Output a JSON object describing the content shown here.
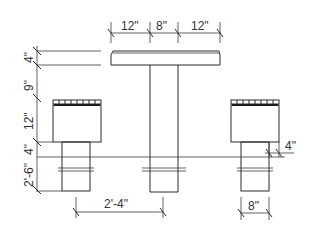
{
  "drawing": {
    "title": "Table and stool elevation",
    "colors": {
      "line": "#2a2a2a",
      "text": "#333333",
      "background": "#ffffff"
    },
    "top_dimensions": [
      "12\"",
      "8\"",
      "12\""
    ],
    "left_dimensions": {
      "table_top_thickness": "4\"",
      "gap_to_seat": "9\"",
      "seat_height": "12\"",
      "seat_base_step": "4\"",
      "overall_seat_height": "2'-6\""
    },
    "bottom_dimensions": {
      "stool_to_table_spacing": "2'-4\"",
      "stool_base_width": "8\""
    },
    "right_dimensions": {
      "base_offset": "4\""
    }
  }
}
